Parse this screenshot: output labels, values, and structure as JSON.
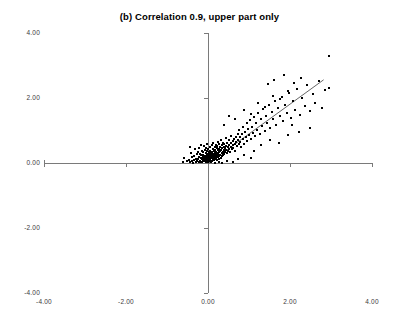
{
  "chart": {
    "title": "(b) Correlation 0.9, upper part only",
    "background_color": "#ffffff",
    "point_color": "#000000",
    "axis_color": "#7a7a7a",
    "line_color": "#555555"
  },
  "chart_data": {
    "type": "scatter",
    "title": "(b) Correlation 0.9, upper part only",
    "xlabel": "",
    "ylabel": "",
    "xlim": [
      -4.0,
      4.0
    ],
    "ylim": [
      -4.0,
      4.0
    ],
    "grid": false,
    "legend": null,
    "xticks": [
      -4.0,
      -2.0,
      0.0,
      2.0,
      4.0
    ],
    "yticks": [
      -4.0,
      -2.0,
      0.0,
      2.0,
      4.0
    ],
    "xtick_labels": [
      "-4.00",
      "-2.00",
      "0.00",
      "2.00",
      "4.00"
    ],
    "ytick_labels": [
      "-4.00",
      "-2.00",
      "0.00",
      "2.00",
      "4.00"
    ],
    "axes_cross_at_origin": true,
    "note": "Bivariate normal with correlation 0.9, truncated to the upper part (y >= 0).",
    "trendline": {
      "x0": 0.0,
      "y0": -0.02,
      "x1": 2.82,
      "y1": 2.56
    },
    "points": [
      [
        -0.52,
        0.06
      ],
      [
        -0.47,
        0.1
      ],
      [
        -0.44,
        0.02
      ],
      [
        -0.41,
        0.3
      ],
      [
        -0.4,
        0.05
      ],
      [
        -0.38,
        0.18
      ],
      [
        -0.36,
        0.01
      ],
      [
        -0.34,
        0.22
      ],
      [
        -0.33,
        0.08
      ],
      [
        -0.31,
        0.44
      ],
      [
        -0.3,
        0.03
      ],
      [
        -0.29,
        0.13
      ],
      [
        -0.28,
        0.27
      ],
      [
        -0.26,
        0.05
      ],
      [
        -0.25,
        0.34
      ],
      [
        -0.24,
        0.12
      ],
      [
        -0.23,
        0.02
      ],
      [
        -0.22,
        0.2
      ],
      [
        -0.21,
        0.47
      ],
      [
        -0.2,
        0.07
      ],
      [
        -0.19,
        0.29
      ],
      [
        -0.18,
        0.14
      ],
      [
        -0.18,
        0.56
      ],
      [
        -0.17,
        0.04
      ],
      [
        -0.16,
        0.24
      ],
      [
        -0.15,
        0.11
      ],
      [
        -0.15,
        0.38
      ],
      [
        -0.14,
        0.02
      ],
      [
        -0.13,
        0.19
      ],
      [
        -0.12,
        0.33
      ],
      [
        -0.12,
        0.08
      ],
      [
        -0.11,
        0.26
      ],
      [
        -0.1,
        0.15
      ],
      [
        -0.1,
        0.51
      ],
      [
        -0.09,
        0.05
      ],
      [
        -0.08,
        0.22
      ],
      [
        -0.08,
        0.4
      ],
      [
        -0.07,
        0.12
      ],
      [
        -0.06,
        0.31
      ],
      [
        -0.06,
        0.03
      ],
      [
        -0.05,
        0.18
      ],
      [
        -0.04,
        0.09
      ],
      [
        -0.04,
        0.45
      ],
      [
        -0.03,
        0.25
      ],
      [
        -0.03,
        0.6
      ],
      [
        -0.02,
        0.14
      ],
      [
        -0.02,
        0.36
      ],
      [
        -0.01,
        0.06
      ],
      [
        -0.01,
        0.21
      ],
      [
        0.0,
        0.11
      ],
      [
        0.0,
        0.29
      ],
      [
        0.0,
        0.02
      ],
      [
        0.01,
        0.17
      ],
      [
        0.01,
        0.42
      ],
      [
        0.02,
        0.08
      ],
      [
        0.02,
        0.24
      ],
      [
        0.03,
        0.33
      ],
      [
        0.03,
        0.13
      ],
      [
        0.04,
        0.05
      ],
      [
        0.04,
        0.49
      ],
      [
        0.05,
        0.19
      ],
      [
        0.05,
        0.28
      ],
      [
        0.06,
        0.1
      ],
      [
        0.06,
        0.38
      ],
      [
        0.07,
        0.22
      ],
      [
        0.07,
        0.04
      ],
      [
        0.08,
        0.31
      ],
      [
        0.08,
        0.15
      ],
      [
        0.09,
        0.54
      ],
      [
        0.09,
        0.26
      ],
      [
        0.1,
        0.07
      ],
      [
        0.1,
        0.35
      ],
      [
        0.11,
        0.18
      ],
      [
        0.11,
        0.44
      ],
      [
        0.12,
        0.12
      ],
      [
        0.12,
        0.29
      ],
      [
        0.13,
        0.21
      ],
      [
        0.13,
        0.62
      ],
      [
        0.14,
        0.09
      ],
      [
        0.14,
        0.37
      ],
      [
        0.15,
        0.25
      ],
      [
        0.15,
        0.16
      ],
      [
        0.16,
        0.48
      ],
      [
        0.16,
        0.32
      ],
      [
        0.17,
        0.11
      ],
      [
        0.17,
        0.23
      ],
      [
        0.18,
        0.41
      ],
      [
        0.18,
        0.28
      ],
      [
        0.19,
        0.14
      ],
      [
        0.19,
        0.56
      ],
      [
        0.2,
        0.35
      ],
      [
        0.2,
        0.2
      ],
      [
        0.21,
        0.46
      ],
      [
        0.21,
        0.08
      ],
      [
        0.22,
        0.3
      ],
      [
        0.22,
        0.24
      ],
      [
        0.23,
        0.52
      ],
      [
        0.24,
        0.17
      ],
      [
        0.24,
        0.39
      ],
      [
        0.25,
        0.27
      ],
      [
        0.25,
        0.66
      ],
      [
        0.26,
        0.12
      ],
      [
        0.26,
        0.44
      ],
      [
        0.27,
        0.33
      ],
      [
        0.28,
        0.21
      ],
      [
        0.28,
        0.58
      ],
      [
        0.29,
        0.36
      ],
      [
        0.3,
        0.26
      ],
      [
        0.3,
        0.49
      ],
      [
        0.31,
        0.15
      ],
      [
        0.32,
        0.41
      ],
      [
        0.32,
        0.71
      ],
      [
        0.33,
        0.3
      ],
      [
        0.34,
        0.54
      ],
      [
        0.34,
        0.22
      ],
      [
        0.35,
        0.45
      ],
      [
        0.36,
        0.34
      ],
      [
        0.37,
        0.63
      ],
      [
        0.37,
        0.26
      ],
      [
        0.38,
        0.5
      ],
      [
        0.39,
        0.39
      ],
      [
        0.4,
        0.29
      ],
      [
        0.4,
        0.58
      ],
      [
        0.41,
        0.46
      ],
      [
        0.42,
        0.35
      ],
      [
        0.43,
        0.76
      ],
      [
        0.44,
        0.52
      ],
      [
        0.45,
        0.41
      ],
      [
        0.46,
        0.31
      ],
      [
        0.47,
        0.63
      ],
      [
        0.48,
        0.48
      ],
      [
        0.49,
        0.38
      ],
      [
        0.5,
        0.7
      ],
      [
        0.51,
        0.56
      ],
      [
        0.52,
        0.44
      ],
      [
        0.53,
        0.33
      ],
      [
        0.55,
        0.61
      ],
      [
        0.56,
        0.5
      ],
      [
        0.57,
        0.83
      ],
      [
        0.58,
        0.42
      ],
      [
        0.6,
        0.67
      ],
      [
        0.61,
        0.55
      ],
      [
        0.62,
        0.46
      ],
      [
        0.64,
        0.74
      ],
      [
        0.65,
        0.6
      ],
      [
        0.66,
        0.38
      ],
      [
        0.68,
        0.81
      ],
      [
        0.69,
        0.66
      ],
      [
        0.7,
        0.52
      ],
      [
        0.72,
        0.9
      ],
      [
        0.73,
        0.71
      ],
      [
        0.75,
        0.58
      ],
      [
        0.76,
        1.02
      ],
      [
        0.78,
        0.8
      ],
      [
        0.79,
        0.64
      ],
      [
        0.81,
        0.49
      ],
      [
        0.83,
        0.88
      ],
      [
        0.85,
        0.73
      ],
      [
        0.86,
        1.1
      ],
      [
        0.88,
        0.6
      ],
      [
        0.9,
        0.95
      ],
      [
        0.92,
        0.79
      ],
      [
        0.94,
        1.22
      ],
      [
        0.96,
        0.68
      ],
      [
        0.98,
        1.04
      ],
      [
        1.0,
        0.86
      ],
      [
        1.02,
        1.31
      ],
      [
        1.05,
        0.74
      ],
      [
        1.07,
        1.12
      ],
      [
        1.1,
        0.93
      ],
      [
        1.12,
        1.42
      ],
      [
        1.15,
        0.82
      ],
      [
        1.18,
        1.24
      ],
      [
        1.2,
        1.02
      ],
      [
        1.23,
        1.55
      ],
      [
        1.26,
        0.9
      ],
      [
        1.29,
        1.35
      ],
      [
        1.32,
        1.13
      ],
      [
        1.35,
        1.66
      ],
      [
        1.38,
        0.99
      ],
      [
        1.41,
        1.45
      ],
      [
        1.45,
        1.24
      ],
      [
        1.48,
        1.78
      ],
      [
        1.52,
        1.08
      ],
      [
        1.55,
        1.57
      ],
      [
        1.59,
        1.34
      ],
      [
        1.63,
        1.9
      ],
      [
        1.67,
        1.18
      ],
      [
        1.71,
        1.68
      ],
      [
        1.75,
        1.44
      ],
      [
        1.8,
        2.02
      ],
      [
        1.84,
        1.28
      ],
      [
        1.88,
        1.79
      ],
      [
        1.93,
        1.54
      ],
      [
        1.98,
        2.15
      ],
      [
        2.03,
        1.38
      ],
      [
        2.08,
        1.9
      ],
      [
        2.13,
        1.64
      ],
      [
        2.18,
        2.28
      ],
      [
        2.24,
        1.48
      ],
      [
        2.3,
        2.01
      ],
      [
        2.36,
        1.75
      ],
      [
        2.42,
        2.4
      ],
      [
        2.48,
        1.59
      ],
      [
        2.55,
        2.13
      ],
      [
        2.62,
        1.86
      ],
      [
        2.7,
        2.52
      ],
      [
        2.78,
        1.7
      ],
      [
        2.86,
        2.25
      ],
      [
        2.94,
        2.3
      ],
      [
        0.38,
        1.18
      ],
      [
        0.52,
        1.46
      ],
      [
        0.66,
        1.34
      ],
      [
        0.88,
        1.62
      ],
      [
        1.04,
        1.5
      ],
      [
        1.22,
        1.86
      ],
      [
        1.4,
        1.72
      ],
      [
        1.58,
        2.06
      ],
      [
        1.76,
        1.96
      ],
      [
        1.94,
        2.22
      ],
      [
        2.1,
        2.45
      ],
      [
        2.26,
        2.62
      ],
      [
        1.86,
        2.7
      ],
      [
        1.62,
        2.56
      ],
      [
        1.46,
        2.42
      ],
      [
        2.96,
        3.3
      ],
      [
        1.12,
        0.38
      ],
      [
        1.3,
        0.55
      ],
      [
        1.52,
        0.72
      ],
      [
        1.74,
        0.62
      ],
      [
        1.96,
        0.85
      ],
      [
        2.22,
        0.94
      ],
      [
        0.88,
        0.24
      ],
      [
        1.06,
        0.16
      ],
      [
        0.72,
        0.12
      ],
      [
        2.48,
        1.08
      ],
      [
        2.04,
        1.16
      ],
      [
        0.46,
        0.05
      ],
      [
        0.62,
        0.02
      ],
      [
        0.34,
        0.01
      ],
      [
        -0.58,
        0.14
      ],
      [
        -0.62,
        0.04
      ],
      [
        0.18,
        0.01
      ],
      [
        0.28,
        0.04
      ],
      [
        -0.45,
        0.48
      ]
    ]
  }
}
